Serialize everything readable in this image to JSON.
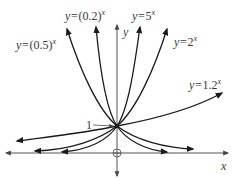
{
  "diagram": {
    "title": "",
    "axes": {
      "x_label": "x",
      "y_label": "y"
    },
    "intersection_label": "1",
    "curves": [
      {
        "id": "half",
        "label_prefix": "y=",
        "base": "(0.5)",
        "exponent": "x",
        "color": "#1a1a1a"
      },
      {
        "id": "fifth",
        "label_prefix": "y=",
        "base": "(0.2)",
        "exponent": "x",
        "color": "#1a1a1a"
      },
      {
        "id": "five",
        "label_prefix": "y=",
        "base": "5",
        "exponent": "x",
        "color": "#1a1a1a"
      },
      {
        "id": "two",
        "label_prefix": "y=",
        "base": "2",
        "exponent": "x",
        "color": "#1a1a1a"
      },
      {
        "id": "onepointtwo",
        "label_prefix": "y=",
        "base": "1.2",
        "exponent": "x",
        "color": "#1a1a1a"
      }
    ],
    "colors": {
      "axis": "#555555",
      "curve": "#1a1a1a",
      "text": "#3a3a3a",
      "background": "#ffffff"
    }
  }
}
